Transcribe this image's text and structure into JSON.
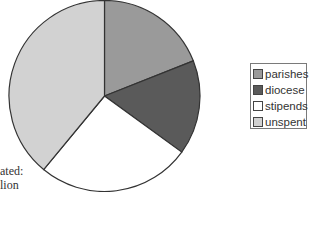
{
  "chart_data": {
    "type": "pie",
    "title": "",
    "slices": [
      {
        "label": "parishes",
        "value": 19,
        "color": "#9a9a9a"
      },
      {
        "label": "diocese",
        "value": 16,
        "color": "#5a5a5a"
      },
      {
        "label": "stipends",
        "value": 26,
        "color": "#ffffff"
      },
      {
        "label": "unspent",
        "value": 39,
        "color": "#d2d2d2"
      }
    ],
    "start_angle": "top",
    "direction": "clockwise",
    "legend": {
      "placement": "right",
      "entries": [
        "parishes",
        "diocese",
        "stipends",
        "unspent"
      ]
    },
    "annotations": [
      "ated:",
      "lion"
    ]
  }
}
